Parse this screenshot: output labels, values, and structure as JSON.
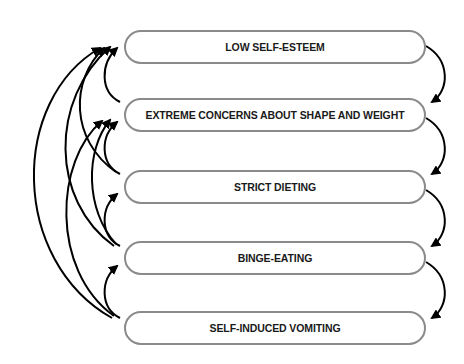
{
  "diagram": {
    "type": "cycle-flow",
    "nodes": [
      {
        "id": "n1",
        "label": "LOW SELF-ESTEEM"
      },
      {
        "id": "n2",
        "label": "EXTREME CONCERNS ABOUT SHAPE AND WEIGHT"
      },
      {
        "id": "n3",
        "label": "STRICT DIETING"
      },
      {
        "id": "n4",
        "label": "BINGE-EATING"
      },
      {
        "id": "n5",
        "label": "SELF-INDUCED VOMITING"
      }
    ],
    "edges_right_downward": [
      {
        "from": "n1",
        "to": "n2"
      },
      {
        "from": "n2",
        "to": "n3"
      },
      {
        "from": "n3",
        "to": "n4"
      },
      {
        "from": "n4",
        "to": "n5"
      }
    ],
    "edges_left_upward": [
      {
        "from": "n2",
        "to": "n1"
      },
      {
        "from": "n3",
        "to": "n1"
      },
      {
        "from": "n4",
        "to": "n1"
      },
      {
        "from": "n5",
        "to": "n1"
      },
      {
        "from": "n3",
        "to": "n2"
      },
      {
        "from": "n4",
        "to": "n2"
      },
      {
        "from": "n5",
        "to": "n2"
      },
      {
        "from": "n4",
        "to": "n3"
      },
      {
        "from": "n5",
        "to": "n4"
      }
    ],
    "colors": {
      "box_border": "#8a8a8a",
      "arrow": "#000000",
      "text": "#1a1a1a"
    }
  }
}
